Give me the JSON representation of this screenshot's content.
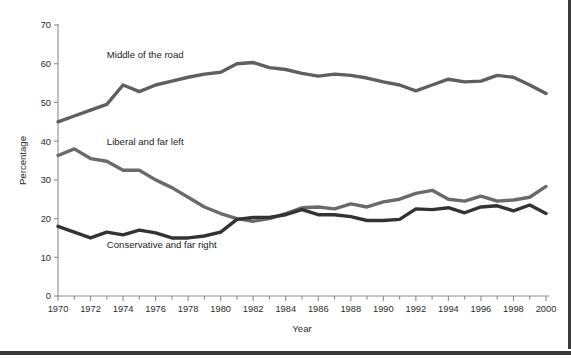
{
  "chart_data": {
    "type": "line",
    "title": "",
    "xlabel": "Year",
    "ylabel": "Percentage",
    "xlim": [
      1970,
      2000
    ],
    "ylim": [
      0,
      70
    ],
    "y_ticks": [
      0,
      10,
      20,
      30,
      40,
      50,
      60,
      70
    ],
    "x_ticks": [
      1970,
      1971,
      1972,
      1973,
      1974,
      1975,
      1976,
      1977,
      1978,
      1979,
      1980,
      1981,
      1982,
      1983,
      1984,
      1985,
      1986,
      1987,
      1988,
      1989,
      1990,
      1991,
      1992,
      1993,
      1994,
      1995,
      1996,
      1997,
      1998,
      1999,
      2000
    ],
    "x_tick_labels": [
      "1970",
      "",
      "1972",
      "",
      "1974",
      "",
      "1976",
      "",
      "1978",
      "",
      "1980",
      "",
      "1982",
      "",
      "1984",
      "",
      "1986",
      "",
      "1988",
      "",
      "1990",
      "",
      "1992",
      "",
      "1994",
      "",
      "1996",
      "",
      "1998",
      "",
      "2000"
    ],
    "grid": false,
    "legend_position": "inline-annotations",
    "x": [
      1970,
      1971,
      1972,
      1973,
      1974,
      1975,
      1976,
      1977,
      1978,
      1979,
      1980,
      1981,
      1982,
      1983,
      1984,
      1985,
      1986,
      1987,
      1988,
      1989,
      1990,
      1991,
      1992,
      1993,
      1994,
      1995,
      1996,
      1997,
      1998,
      1999,
      2000
    ],
    "series": [
      {
        "name": "Middle of the road",
        "color": "#5f5f5f",
        "label_x": 1973,
        "label_y": 61.5,
        "values": [
          45.0,
          46.5,
          48.0,
          49.5,
          54.5,
          52.8,
          54.5,
          55.5,
          56.5,
          57.3,
          57.8,
          60.0,
          60.3,
          59.0,
          58.5,
          57.5,
          56.8,
          57.3,
          57.0,
          56.3,
          55.3,
          54.5,
          53.0,
          54.5,
          56.0,
          55.3,
          55.5,
          57.0,
          56.5,
          54.5,
          52.3
        ]
      },
      {
        "name": "Liberal and far left",
        "color": "#6a6a6a",
        "label_x": 1973,
        "label_y": 39.0,
        "values": [
          36.3,
          38.0,
          35.5,
          34.8,
          32.5,
          32.5,
          30.0,
          28.0,
          25.5,
          23.0,
          21.3,
          20.0,
          19.3,
          20.0,
          21.3,
          22.8,
          23.0,
          22.5,
          23.8,
          23.0,
          24.3,
          25.0,
          26.5,
          27.3,
          25.0,
          24.5,
          25.8,
          24.5,
          24.8,
          25.5,
          28.3
        ]
      },
      {
        "name": "Conservative and far right",
        "color": "#333333",
        "label_x": 1973,
        "label_y": 12.5,
        "values": [
          18.0,
          16.5,
          15.0,
          16.5,
          15.8,
          17.0,
          16.3,
          15.0,
          15.0,
          15.5,
          16.5,
          19.8,
          20.3,
          20.3,
          21.0,
          22.3,
          21.0,
          21.0,
          20.5,
          19.5,
          19.5,
          19.8,
          22.5,
          22.3,
          22.8,
          21.5,
          23.0,
          23.3,
          22.0,
          23.5,
          21.3
        ]
      }
    ]
  },
  "figure": {
    "background_color": "#ffffff",
    "border_color": "#3a3a3a"
  }
}
